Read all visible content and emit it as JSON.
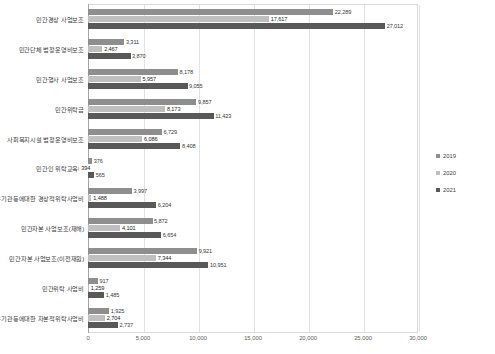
{
  "chart_data": {
    "type": "bar",
    "orientation": "horizontal",
    "title": "",
    "xlabel": "",
    "ylabel": "",
    "xlim": [
      0,
      30000
    ],
    "xticks": [
      "0",
      "5,000",
      "10,000",
      "15,000",
      "20,000",
      "25,000",
      "30,000"
    ],
    "xtick_values": [
      0,
      5000,
      10000,
      15000,
      20000,
      25000,
      30000
    ],
    "grid": true,
    "legend_position": "right",
    "categories": [
      "민간경상 사업보조",
      "민간단체 법정운영비보조",
      "민간행사 사업보조",
      "민간위탁금",
      "사회복지시설 법정운영비보조",
      "민간인 위탁교육비",
      "공기관등에대한 경상적위탁사업비",
      "민간자본 사업보조(재해)",
      "민간자본 사업보조(이전재원)",
      "민간위탁 사업비",
      "공기관등에대한 자본적위탁사업비"
    ],
    "series": [
      {
        "name": "2019",
        "color": "#8e8e8e",
        "values": [
          22289,
          3311,
          8178,
          9857,
          6729,
          376,
          3997,
          5872,
          9921,
          917,
          1925
        ],
        "labels": [
          "22,289",
          "3,311",
          "8,178",
          "9,857",
          "6,729",
          "376",
          "3,997",
          "5,872",
          "9,921",
          "917",
          "1,925"
        ]
      },
      {
        "name": "2020",
        "color": "#bfbfbf",
        "values": [
          17617,
          2467,
          5957,
          8173,
          6086,
          394,
          1488,
          4101,
          7344,
          1259,
          2704
        ],
        "labels": [
          "17,617",
          "2,467",
          "5,957",
          "8,173",
          "6,086",
          "394",
          "1,488",
          "4,101",
          "7,344",
          "1,259",
          "2,704"
        ]
      },
      {
        "name": "2021",
        "color": "#595959",
        "values": [
          27012,
          3870,
          9055,
          11423,
          8408,
          565,
          6204,
          6654,
          10951,
          1485,
          2737
        ],
        "labels": [
          "27,012",
          "3,870",
          "9,055",
          "11,423",
          "8,408",
          "565",
          "6,204",
          "6,654",
          "10,951",
          "1,485",
          "2,737"
        ]
      }
    ]
  },
  "legend": {
    "items": [
      {
        "label": "2019"
      },
      {
        "label": "2020"
      },
      {
        "label": "2021"
      }
    ]
  }
}
